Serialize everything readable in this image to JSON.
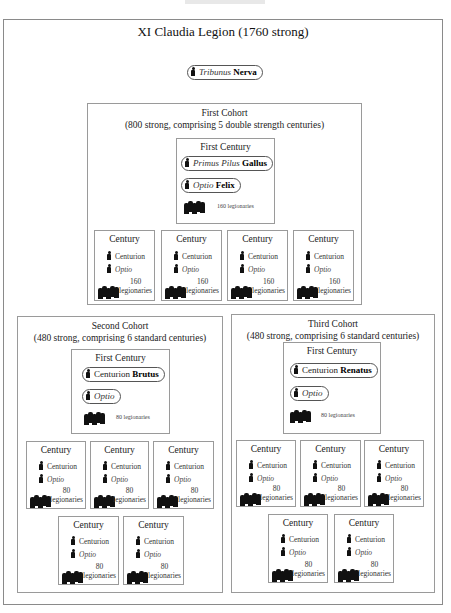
{
  "legion": {
    "title": "XI Claudia Legion (1760 strong)",
    "tribune": {
      "rank": "Tribunus",
      "name": "Nerva"
    }
  },
  "cohorts": [
    {
      "title": "First Cohort",
      "subtitle": "(800 strong,  comprising 5 double strength centuries)",
      "first_century": {
        "title": "First Century",
        "officer1": {
          "rank": "Primus Pilus",
          "name": "Gallus"
        },
        "officer2": {
          "rank": "Optio",
          "name": "Felix"
        },
        "legionaries": "160 legionaries"
      },
      "centuries": [
        {
          "title": "Century",
          "centurion": "Centurion",
          "optio": "Optio",
          "count": "160",
          "unit": "legionaries"
        },
        {
          "title": "Century",
          "centurion": "Centurion",
          "optio": "Optio",
          "count": "160",
          "unit": "legionaries"
        },
        {
          "title": "Century",
          "centurion": "Centurion",
          "optio": "Optio",
          "count": "160",
          "unit": "legionaries"
        },
        {
          "title": "Century",
          "centurion": "Centurion",
          "optio": "Optio",
          "count": "160",
          "unit": "legionaries"
        }
      ]
    },
    {
      "title": "Second Cohort",
      "subtitle": "(480 strong, comprising 6 standard centuries)",
      "first_century": {
        "title": "First Century",
        "officer1": {
          "rank": "Centurion",
          "name": "Brutus"
        },
        "officer2": {
          "rank": "Optio",
          "name": ""
        },
        "legionaries": "80 legionaries"
      },
      "centuries": [
        {
          "title": "Century",
          "centurion": "Centurion",
          "optio": "Optio",
          "count": "80",
          "unit": "legionaries"
        },
        {
          "title": "Century",
          "centurion": "Centurion",
          "optio": "Optio",
          "count": "80",
          "unit": "legionaries"
        },
        {
          "title": "Century",
          "centurion": "Centurion",
          "optio": "Optio",
          "count": "80",
          "unit": "legionaries"
        },
        {
          "title": "Century",
          "centurion": "Centurion",
          "optio": "Optio",
          "count": "80",
          "unit": "legionaries"
        },
        {
          "title": "Century",
          "centurion": "Centurion",
          "optio": "Optio",
          "count": "80",
          "unit": "legionaries"
        }
      ]
    },
    {
      "title": "Third Cohort",
      "subtitle": "(480 strong, comprising 6 standard centuries)",
      "first_century": {
        "title": "First Century",
        "officer1": {
          "rank": "Centurion",
          "name": "Renatus"
        },
        "officer2": {
          "rank": "Optio",
          "name": ""
        },
        "legionaries": "80 legionaries"
      },
      "centuries": [
        {
          "title": "Century",
          "centurion": "Centurion",
          "optio": "Optio",
          "count": "80",
          "unit": "legionaries"
        },
        {
          "title": "Century",
          "centurion": "Centurion",
          "optio": "Optio",
          "count": "80",
          "unit": "legionaries"
        },
        {
          "title": "Century",
          "centurion": "Centurion",
          "optio": "Optio",
          "count": "80",
          "unit": "legionaries"
        },
        {
          "title": "Century",
          "centurion": "Centurion",
          "optio": "Optio",
          "count": "80",
          "unit": "legionaries"
        },
        {
          "title": "Century",
          "centurion": "Centurion",
          "optio": "Optio",
          "count": "80",
          "unit": "legionaries"
        }
      ]
    }
  ]
}
